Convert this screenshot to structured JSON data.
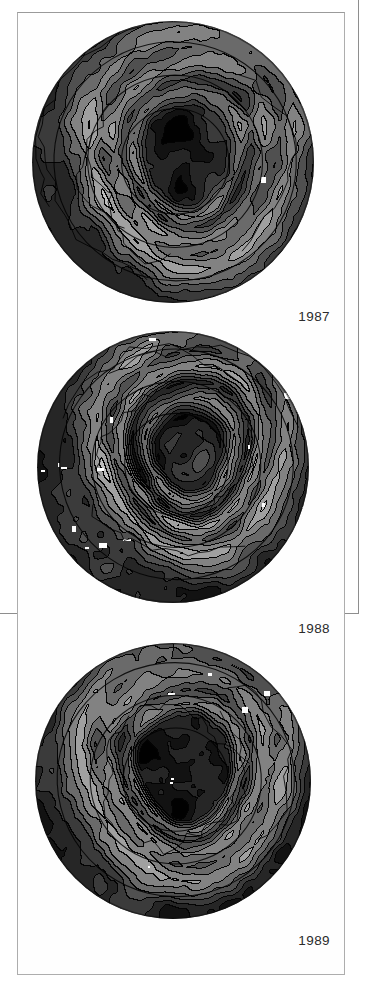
{
  "figure": {
    "kind": "scanned-figure",
    "background_color": "#ffffff",
    "frame_color": "#adadad",
    "outer_frame_color": "#8e8e8e",
    "caption_text_color": "#2b2b2b"
  },
  "panels": [
    {
      "id": "panel-1987",
      "year_label": "1987",
      "map_title": "1987",
      "projection": "south-polar-stereographic",
      "globe_diameter_px": 282
    },
    {
      "id": "panel-1988",
      "year_label": "1988",
      "map_title": "1988",
      "projection": "south-polar-stereographic",
      "globe_diameter_px": 272
    },
    {
      "id": "panel-1989",
      "year_label": "1989",
      "map_title": "1989",
      "projection": "south-polar-stereographic",
      "globe_diameter_px": 276
    }
  ],
  "chart_data": {
    "type": "heatmap",
    "subtitle": "",
    "xlabel": "",
    "ylabel": "",
    "colormap": "grayscale",
    "grid": false,
    "legend_position": "none",
    "annotations": [
      "1987",
      "1988",
      "1989"
    ],
    "panels": [
      {
        "name": "1987",
        "center_value": 0.04,
        "rim_value": 0.42,
        "rings": [
          {
            "radius_frac": 0.0,
            "gray": 0.05
          },
          {
            "radius_frac": 0.17,
            "gray": 0.06
          },
          {
            "radius_frac": 0.3,
            "gray": 0.1
          },
          {
            "radius_frac": 0.4,
            "gray": 0.3
          },
          {
            "radius_frac": 0.47,
            "gray": 0.18
          },
          {
            "radius_frac": 0.56,
            "gray": 0.33
          },
          {
            "radius_frac": 0.66,
            "gray": 0.24
          },
          {
            "radius_frac": 0.76,
            "gray": 0.4
          },
          {
            "radius_frac": 0.86,
            "gray": 0.3
          },
          {
            "radius_frac": 0.94,
            "gray": 0.22
          },
          {
            "radius_frac": 1.0,
            "gray": 0.16
          }
        ],
        "offset": [
          0.06,
          -0.02
        ],
        "seed": 1987,
        "bright_spots": 1,
        "contour_lines": true
      },
      {
        "name": "1988",
        "center_value": 0.1,
        "rim_value": 0.4,
        "rings": [
          {
            "radius_frac": 0.0,
            "gray": 0.09
          },
          {
            "radius_frac": 0.14,
            "gray": 0.16
          },
          {
            "radius_frac": 0.24,
            "gray": 0.07
          },
          {
            "radius_frac": 0.34,
            "gray": 0.34
          },
          {
            "radius_frac": 0.44,
            "gray": 0.12
          },
          {
            "radius_frac": 0.53,
            "gray": 0.36
          },
          {
            "radius_frac": 0.62,
            "gray": 0.2
          },
          {
            "radius_frac": 0.73,
            "gray": 0.41
          },
          {
            "radius_frac": 0.84,
            "gray": 0.28
          },
          {
            "radius_frac": 0.93,
            "gray": 0.2
          },
          {
            "radius_frac": 1.0,
            "gray": 0.14
          }
        ],
        "offset": [
          0.1,
          -0.08
        ],
        "seed": 1988,
        "bright_spots": 14,
        "contour_lines": true
      },
      {
        "name": "1989",
        "center_value": 0.03,
        "rim_value": 0.38,
        "rings": [
          {
            "radius_frac": 0.0,
            "gray": 0.03
          },
          {
            "radius_frac": 0.2,
            "gray": 0.04
          },
          {
            "radius_frac": 0.33,
            "gray": 0.07
          },
          {
            "radius_frac": 0.41,
            "gray": 0.3
          },
          {
            "radius_frac": 0.49,
            "gray": 0.15
          },
          {
            "radius_frac": 0.58,
            "gray": 0.34
          },
          {
            "radius_frac": 0.68,
            "gray": 0.25
          },
          {
            "radius_frac": 0.79,
            "gray": 0.39
          },
          {
            "radius_frac": 0.88,
            "gray": 0.29
          },
          {
            "radius_frac": 0.95,
            "gray": 0.21
          },
          {
            "radius_frac": 1.0,
            "gray": 0.15
          }
        ],
        "offset": [
          0.08,
          -0.04
        ],
        "seed": 1989,
        "bright_spots": 5,
        "contour_lines": true
      }
    ]
  }
}
